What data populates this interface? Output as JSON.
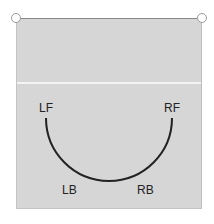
{
  "diagram": {
    "labels": {
      "left_front": "LF",
      "right_front": "RF",
      "left_back": "LB",
      "right_back": "RB"
    },
    "colors": {
      "field_fill": "#d6d6d6",
      "arc_stroke": "#222222",
      "divider": "#f4f4f4"
    }
  }
}
